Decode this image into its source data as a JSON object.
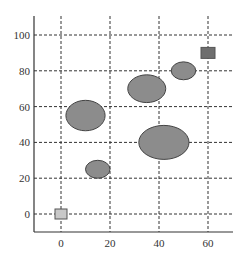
{
  "chart_data": {
    "type": "scatter",
    "title": "",
    "xlabel": "",
    "ylabel": "",
    "xlim": [
      -10,
      70
    ],
    "ylim": [
      -10,
      110
    ],
    "x_ticks": [
      0,
      20,
      40,
      60
    ],
    "y_ticks": [
      0,
      20,
      40,
      60,
      80,
      100
    ],
    "grid": true,
    "legend": null,
    "series": [
      {
        "name": "ellipses",
        "marker": "ellipse",
        "color": "#8c8c8c",
        "points": [
          {
            "x": 10,
            "y": 55,
            "w": 16,
            "h": 17
          },
          {
            "x": 35,
            "y": 70,
            "w": 15.5,
            "h": 15.5
          },
          {
            "x": 42,
            "y": 40,
            "w": 20.5,
            "h": 19
          },
          {
            "x": 15,
            "y": 25,
            "w": 10,
            "h": 10
          },
          {
            "x": 50,
            "y": 80,
            "w": 10,
            "h": 10
          }
        ]
      },
      {
        "name": "squares",
        "marker": "square",
        "points": [
          {
            "x": 60,
            "y": 90,
            "color": "#6e6e6e"
          },
          {
            "x": 0,
            "y": 0,
            "color": "#c8c8c8"
          }
        ]
      }
    ]
  },
  "layout": {
    "x0_px": 61,
    "x_scale": 2.45,
    "y0_px": 214,
    "y_scale": 1.79
  }
}
